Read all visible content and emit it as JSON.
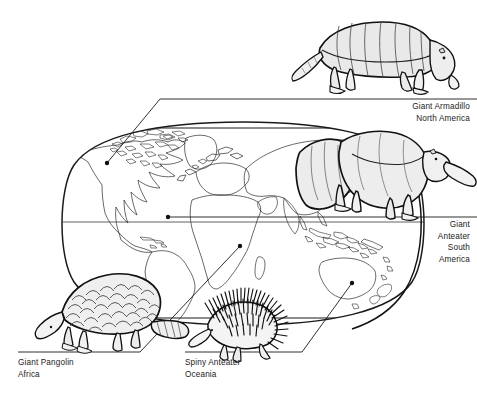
{
  "figure": {
    "background_color": "#ffffff",
    "line_color": "#1a1a1a",
    "fill_color": "#ebebeb",
    "title": ""
  },
  "map": {
    "name": "world-map",
    "projection": "oval world map",
    "outline_color": "#1a1a1a",
    "fill_color": "#ffffff"
  },
  "callouts": [
    {
      "key": "armadillo",
      "animal": "Giant Armadillo",
      "region": "North America",
      "icon": "giant-armadillo-illustration",
      "align": "right",
      "rule": {
        "x1": 344,
        "y1": 99,
        "x2": 477,
        "y2": 99
      },
      "leader": {
        "x1": 160,
        "y1": 99,
        "x2": 105,
        "y2": 163
      },
      "dot": {
        "x": 105,
        "y": 163
      }
    },
    {
      "key": "anteater",
      "animal": "Giant Anteater",
      "region": "South America",
      "icon": "giant-anteater-illustration",
      "align": "right",
      "rule": {
        "x1": 344,
        "y1": 217,
        "x2": 477,
        "y2": 217
      },
      "leader": {
        "x1": 344,
        "y1": 217,
        "x2": 168,
        "y2": 217
      },
      "dot": {
        "x": 168,
        "y": 217
      }
    },
    {
      "key": "pangolin",
      "animal": "Giant Pangolin",
      "region": "Africa",
      "icon": "giant-pangolin-illustration",
      "align": "left",
      "rule": {
        "x1": 18,
        "y1": 352,
        "x2": 140,
        "y2": 352
      },
      "leader": {
        "x1": 140,
        "y1": 352,
        "x2": 238,
        "y2": 245
      },
      "dot": {
        "x": 238,
        "y": 245
      }
    },
    {
      "key": "echidna",
      "animal": "Spiny Anteater",
      "region": "Oceania",
      "icon": "spiny-anteater-illustration",
      "align": "left",
      "rule": {
        "x1": 185,
        "y1": 352,
        "x2": 300,
        "y2": 352
      },
      "leader": {
        "x1": 300,
        "y1": 352,
        "x2": 351,
        "y2": 283
      },
      "dot": {
        "x": 351,
        "y": 283
      }
    }
  ],
  "labels": {
    "armadillo": {
      "line1": "Giant Armadillo",
      "line2": "North America"
    },
    "anteater": {
      "line1": "Giant",
      "line2": "Anteater",
      "line3": "South",
      "line4": "America"
    },
    "pangolin": {
      "line1": "Giant Pangolin",
      "line2": "Africa"
    },
    "echidna": {
      "line1": "Spiny Anteater",
      "line2": "Oceania"
    }
  }
}
